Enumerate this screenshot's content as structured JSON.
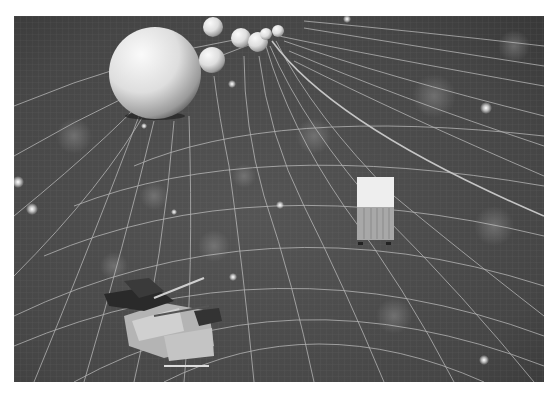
{
  "scene": {
    "description": "Grayscale 3D render of a curved spacetime wireframe grid with spheres, a cargo container and military vehicles",
    "colors": {
      "background": "#4a4a4a",
      "background_dark": "#2e2e2e",
      "grid_line": "#d8d8d8",
      "sphere_light": "#f4f4f4",
      "sphere_shadow": "#7a7a7a",
      "star": "#ffffff"
    },
    "spheres": [
      {
        "cx": 141,
        "cy": 57,
        "r": 46
      },
      {
        "cx": 199,
        "cy": 11,
        "r": 10
      },
      {
        "cx": 198,
        "cy": 44,
        "r": 13
      },
      {
        "cx": 227,
        "cy": 22,
        "r": 10
      },
      {
        "cx": 244,
        "cy": 26,
        "r": 10
      },
      {
        "cx": 252,
        "cy": 18,
        "r": 6
      },
      {
        "cx": 264,
        "cy": 15,
        "r": 6
      }
    ],
    "stars": [
      {
        "x": 4,
        "y": 166,
        "r": 3
      },
      {
        "x": 18,
        "y": 193,
        "r": 3
      },
      {
        "x": 218,
        "y": 68,
        "r": 2
      },
      {
        "x": 266,
        "y": 189,
        "r": 2
      },
      {
        "x": 333,
        "y": 3,
        "r": 2
      },
      {
        "x": 472,
        "y": 92,
        "r": 3
      },
      {
        "x": 470,
        "y": 344,
        "r": 3
      },
      {
        "x": 219,
        "y": 261,
        "r": 2
      }
    ],
    "container": {
      "x": 343,
      "y": 161,
      "w": 37,
      "top_h": 30,
      "front_h": 33
    },
    "vehicles": [
      {
        "name": "tank-group-left",
        "x": 75,
        "y": 260
      },
      {
        "name": "flatbed-vehicle",
        "x": 105,
        "y": 290
      }
    ]
  }
}
